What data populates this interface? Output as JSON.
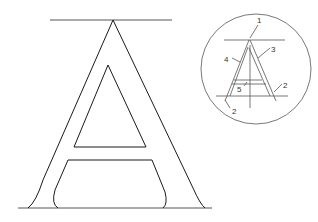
{
  "diagram": {
    "main_letter": "A",
    "detail_labels": {
      "label_1": "1",
      "label_2_right": "2",
      "label_2_left": "2",
      "label_3": "3",
      "label_4": "4",
      "label_5": "5"
    },
    "colors": {
      "stroke": "#1a1a1a",
      "detail_stroke": "#555555",
      "background": "#ffffff"
    }
  }
}
